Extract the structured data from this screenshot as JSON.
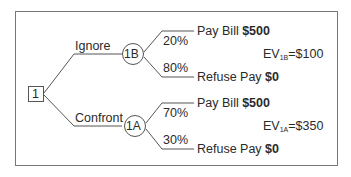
{
  "diagram": {
    "type": "decision-tree",
    "root": {
      "label": "1"
    },
    "branches": [
      {
        "label": "Ignore",
        "node": "1B",
        "outcomes": [
          {
            "probability": "20%",
            "label": "Pay Bill",
            "value": "$500"
          },
          {
            "probability": "80%",
            "label": "Refuse Pay",
            "value": "$0"
          }
        ],
        "ev_prefix": "EV",
        "ev_sub": "1B",
        "ev_value": "=$100"
      },
      {
        "label": "Confront",
        "node": "1A",
        "outcomes": [
          {
            "probability": "70%",
            "label": "Pay Bill",
            "value": "$500"
          },
          {
            "probability": "30%",
            "label": "Refuse Pay",
            "value": "$0"
          }
        ],
        "ev_prefix": "EV",
        "ev_sub": "1A",
        "ev_value": "=$350"
      }
    ]
  },
  "colors": {
    "line": "#555555",
    "text": "#2a2a2a",
    "frame": "#777777"
  }
}
